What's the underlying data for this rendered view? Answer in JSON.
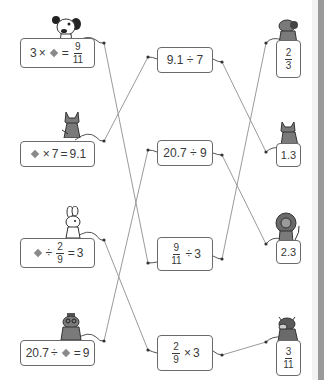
{
  "colors": {
    "line": "#9a9a9a",
    "box_border": "#6a6a6a",
    "text": "#3a3a3a",
    "animal": "#6e6e6e",
    "strip": "#9a9a9a"
  },
  "left_equations": [
    {
      "animal": "dog-white",
      "parts": {
        "a": "3",
        "op1": "×",
        "op2": "=",
        "num": "9",
        "den": "11"
      }
    },
    {
      "animal": "cat",
      "parts": {
        "op1": "×",
        "b": "7",
        "op2": "=",
        "c": "9.1"
      }
    },
    {
      "animal": "rabbit",
      "parts": {
        "op1": "÷",
        "num": "2",
        "den": "9",
        "op2": "=",
        "c": "3"
      }
    },
    {
      "animal": "mole",
      "parts": {
        "a": "20.7",
        "op1": "÷",
        "op2": "=",
        "c": "9"
      }
    }
  ],
  "middle_expressions": [
    {
      "text": "9.1 ÷ 7"
    },
    {
      "text": "20.7 ÷ 9"
    },
    {
      "num": "9",
      "den": "11",
      "op": "÷",
      "b": "3"
    },
    {
      "num": "2",
      "den": "9",
      "op": "×",
      "b": "3"
    }
  ],
  "right_answers": [
    {
      "animal": "dog-gray",
      "num": "2",
      "den": "3"
    },
    {
      "animal": "cat",
      "value": "1.3"
    },
    {
      "animal": "lion",
      "value": "2.3"
    },
    {
      "animal": "cow",
      "num": "3",
      "den": "11"
    }
  ],
  "connections": {
    "left_to_middle": [
      [
        1,
        3
      ],
      [
        2,
        1
      ],
      [
        3,
        4
      ],
      [
        4,
        2
      ]
    ],
    "middle_to_right": [
      [
        1,
        2
      ],
      [
        2,
        3
      ],
      [
        3,
        1
      ],
      [
        4,
        4
      ]
    ]
  }
}
